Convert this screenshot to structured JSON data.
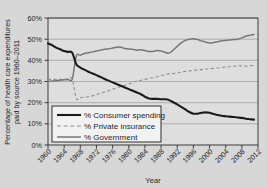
{
  "chart_data": {
    "type": "line",
    "title": "",
    "xlabel": "Year",
    "ylabel": "Percentage of health care expenditures paid by source 1960–2011",
    "xlim": [
      1960,
      2012
    ],
    "ylim": [
      0,
      60
    ],
    "grid": true,
    "legend_position": "lower-left-inside",
    "x_ticks": [
      "1960",
      "1964",
      "1968",
      "1972",
      "1976",
      "1980",
      "1984",
      "1988",
      "1992",
      "1996",
      "2000",
      "2004",
      "2008",
      "2012"
    ],
    "y_ticks": [
      "0%",
      "10%",
      "20%",
      "30%",
      "40%",
      "50%",
      "60%"
    ],
    "x": [
      1960,
      1961,
      1962,
      1963,
      1964,
      1965,
      1966,
      1967,
      1968,
      1969,
      1970,
      1971,
      1972,
      1973,
      1974,
      1975,
      1976,
      1977,
      1978,
      1979,
      1980,
      1981,
      1982,
      1983,
      1984,
      1985,
      1986,
      1987,
      1988,
      1989,
      1990,
      1991,
      1992,
      1993,
      1994,
      1995,
      1996,
      1997,
      1998,
      1999,
      2000,
      2001,
      2002,
      2003,
      2004,
      2005,
      2006,
      2007,
      2008,
      2009,
      2010,
      2011
    ],
    "series": [
      {
        "name": "% Consumer spending",
        "style": "solid-thick-black",
        "color": "#1b1b1b",
        "values": [
          48.0,
          47.2,
          46.0,
          45.2,
          44.4,
          44.0,
          43.6,
          38.2,
          36.6,
          35.6,
          34.6,
          33.8,
          33.0,
          32.2,
          31.2,
          30.4,
          29.6,
          28.8,
          28.0,
          27.2,
          26.4,
          25.6,
          24.8,
          24.0,
          22.8,
          22.0,
          21.8,
          21.8,
          21.6,
          21.6,
          21.2,
          20.2,
          19.2,
          18.0,
          16.8,
          15.6,
          14.8,
          14.8,
          15.2,
          15.4,
          15.2,
          14.6,
          14.2,
          13.8,
          13.6,
          13.4,
          13.2,
          13.0,
          12.8,
          12.4,
          12.2,
          12.0
        ]
      },
      {
        "name": "% Private insurance",
        "style": "dashed-gray",
        "color": "#8e8e8e",
        "values": [
          31.0,
          31.0,
          31.0,
          31.0,
          31.0,
          31.2,
          31.2,
          22.0,
          22.4,
          22.6,
          22.8,
          23.2,
          23.8,
          24.4,
          25.0,
          25.6,
          26.4,
          27.0,
          27.6,
          28.2,
          28.8,
          29.6,
          30.2,
          30.6,
          31.0,
          31.4,
          31.8,
          32.2,
          32.8,
          33.2,
          33.6,
          33.8,
          34.0,
          34.4,
          34.8,
          35.0,
          35.2,
          35.4,
          35.6,
          35.8,
          36.0,
          36.2,
          36.4,
          36.6,
          36.8,
          37.0,
          37.2,
          37.4,
          37.4,
          37.2,
          37.4,
          37.6
        ]
      },
      {
        "name": "% Government",
        "style": "solid-gray",
        "color": "#777777",
        "values": [
          30.0,
          30.2,
          30.4,
          30.6,
          30.8,
          31.0,
          31.2,
          42.0,
          42.4,
          43.2,
          43.6,
          44.0,
          44.4,
          44.8,
          45.2,
          45.4,
          45.8,
          46.2,
          46.2,
          45.6,
          45.4,
          45.2,
          44.8,
          45.0,
          44.6,
          44.2,
          44.2,
          44.6,
          44.4,
          43.8,
          43.4,
          44.8,
          46.6,
          48.2,
          49.4,
          50.0,
          50.2,
          49.8,
          49.2,
          48.6,
          48.2,
          48.4,
          48.8,
          49.2,
          49.4,
          49.6,
          49.8,
          50.0,
          50.6,
          51.4,
          51.8,
          52.2
        ]
      }
    ],
    "annotations": []
  },
  "legend": {
    "entries": [
      {
        "label": "% Consumer spending"
      },
      {
        "label": "% Private insurance"
      },
      {
        "label": "% Government"
      }
    ]
  },
  "colors": {
    "page_background": "#d7d7d7",
    "plot_background": "#dedede",
    "axis": "#3a3a3a",
    "grid": "#9a9a9a",
    "consumer": "#1b1b1b",
    "private_insurance": "#8e8e8e",
    "government": "#777777"
  }
}
